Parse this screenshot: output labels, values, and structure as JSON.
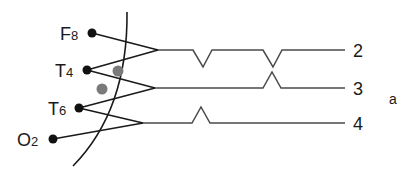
{
  "diagram": {
    "electrodes": [
      {
        "name": "F8",
        "main": "F",
        "sub": "8"
      },
      {
        "name": "T4",
        "main": "T",
        "sub": "4"
      },
      {
        "name": "T6",
        "main": "T",
        "sub": "6"
      },
      {
        "name": "O2",
        "main": "O",
        "sub": "2"
      }
    ],
    "channels": [
      {
        "label": "2",
        "pair": [
          "F8",
          "T4"
        ],
        "deflections": [
          "down",
          "down"
        ]
      },
      {
        "label": "3",
        "pair": [
          "T4",
          "T6"
        ],
        "deflections": [
          "up"
        ]
      },
      {
        "label": "4",
        "pair": [
          "T6",
          "O2"
        ],
        "deflections": [
          "up"
        ]
      }
    ],
    "panel_label": "a",
    "colors": {
      "line": "#1a1a1a",
      "trace": "#4a4a4a",
      "focus_dot": "#7a7a7a"
    }
  }
}
